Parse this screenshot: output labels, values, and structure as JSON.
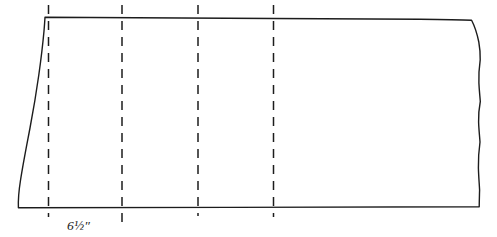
{
  "figure": {
    "kind": "line-drawing",
    "title": "Fabric panel with fold lines",
    "background_color": "#ffffff",
    "ink_color": "#1c1c1c",
    "canvas": {
      "width": 497,
      "height": 237
    }
  },
  "shape": {
    "name": "fabric-panel-outline",
    "description": "Hand-drawn quadrilateral fabric panel, left edge slanted outward",
    "stroke_color": "#1c1c1c",
    "stroke_width": 1.4,
    "fill_color": "#ffffff",
    "corners": {
      "top_left": "45,17",
      "top_right": "472,20",
      "bottom_right": "479,207",
      "bottom_left": "18,207"
    },
    "path": "M 45.0 17.2 C 120 18.0 300 18.6 420 19.2 C 443 19.4 461 19.7 471.6 20.2 C 474.6 26 477.2 34 478.8 42 C 479.9 48 480.3 54 480.2 59.8 C 479.2 67 478.6 75 478.9 83 C 479.2 90 479.9 96 480.3 101.5 C 479.1 108 478.4 115 478.6 122 C 478.8 129 479.6 136 480.0 142 C 478.9 150 478.2 159 478.4 168 C 478.6 176 479.3 184 479.6 190 C 479.4 196 479.3 202 479.2 206.8 C 430 207.0 330 207.2 230 207.4 C 150 207.5 70 207.6 18.4 207.7 C 18.1 200 18.8 191 20.4 181 C 23.0 164 26.6 146 30.0 128 C 33.4 110 36.4 92 38.8 75 C 41.2 58 42.9 43 44.0 31 C 44.5 25 44.8 20.5 45.0 17.2 Z"
  },
  "fold_lines": {
    "name": "fold-lines",
    "count": 4,
    "style": "dashed",
    "stroke_color": "#1c1c1c",
    "stroke_width": 1.5,
    "dash_pattern": "9 7",
    "lines": [
      {
        "id": "fold-line-1",
        "x": 48.5,
        "y_top": 5,
        "y_bottom": 217
      },
      {
        "id": "fold-line-2",
        "x": 122.0,
        "y_top": 5,
        "y_bottom": 223
      },
      {
        "id": "fold-line-3",
        "x": 198.0,
        "y_top": 5,
        "y_bottom": 216
      },
      {
        "id": "fold-line-4",
        "x": 273.5,
        "y_top": 5,
        "y_bottom": 217
      }
    ]
  },
  "dimension": {
    "name": "width-dimension-label",
    "value": "6½″",
    "x": 67,
    "y": 230,
    "between_fold_lines": [
      1,
      2
    ]
  }
}
